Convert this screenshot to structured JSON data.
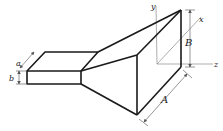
{
  "diagram": {
    "type": "pyramidal-horn-antenna",
    "labels": {
      "waveguide_width": "a",
      "waveguide_height": "b",
      "aperture_width": "A",
      "aperture_height": "B",
      "axis_x": "x",
      "axis_y": "y",
      "axis_z": "z"
    },
    "colors": {
      "edges": "#1a1a1a",
      "axes": "#8a8a8a",
      "dimension_lines": "#6a6a6a",
      "background": "#ffffff"
    }
  }
}
